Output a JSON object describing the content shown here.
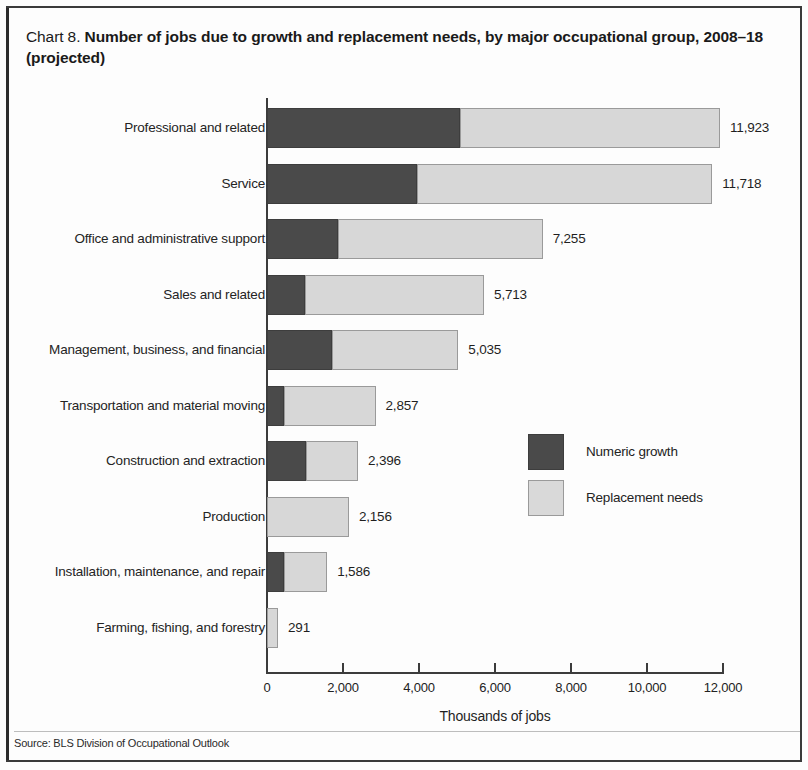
{
  "title": {
    "prefix": "Chart 8.",
    "main": "Number of jobs due to growth and replacement needs, by major occupational group, 2008–18 (projected)"
  },
  "source_note": "Source: BLS Division of Occupational Outlook",
  "legend": {
    "growth_label": "Numeric growth",
    "replacement_label": "Replacement needs"
  },
  "colors": {
    "growth": "#4a4a4a",
    "replacement": "#d7d7d7",
    "axis": "#3c3c3c",
    "text": "#1f1f1f"
  },
  "chart_data": {
    "type": "bar",
    "orientation": "horizontal",
    "stacked": true,
    "title": "Number of jobs due to growth and replacement needs, by major occupational group, 2008–18 (projected)",
    "xlabel": "Thousands of jobs",
    "ylabel": "",
    "xlim": [
      0,
      12000
    ],
    "xticks": [
      0,
      2000,
      4000,
      6000,
      8000,
      10000,
      12000
    ],
    "xtick_labels": [
      "0",
      "2,000",
      "4,000",
      "6,000",
      "8,000",
      "10,000",
      "12,000"
    ],
    "grid": false,
    "legend_position": "center-right",
    "categories": [
      "Professional and related",
      "Service",
      "Office and administrative support",
      "Sales and related",
      "Management, business, and financial",
      "Transportation and material moving",
      "Construction and extraction",
      "Production",
      "Installation, maintenance, and repair",
      "Farming, fishing, and forestry"
    ],
    "series": [
      {
        "name": "Numeric growth",
        "color": "#4a4a4a",
        "values": [
          5085,
          3957,
          1874,
          1002,
          1709,
          457,
          1030,
          0,
          450,
          0
        ]
      },
      {
        "name": "Replacement needs",
        "color": "#d7d7d7",
        "values": [
          6838,
          7761,
          5381,
          4711,
          3326,
          2400,
          1366,
          2156,
          1136,
          291
        ]
      }
    ],
    "totals": [
      11923,
      11718,
      7255,
      5713,
      5035,
      2857,
      2396,
      2156,
      1586,
      291
    ],
    "total_labels": [
      "11,923",
      "11,718",
      "7,255",
      "5,713",
      "5,035",
      "2,857",
      "2,396",
      "2,156",
      "1,586",
      "291"
    ]
  },
  "axis": {
    "xaxis_title": "Thousands of jobs"
  }
}
